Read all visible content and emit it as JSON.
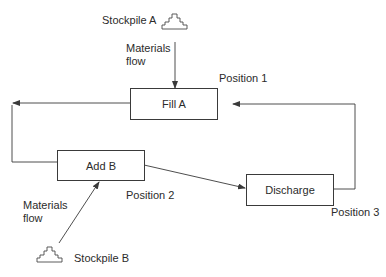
{
  "nodes": {
    "fill_a": {
      "label": "Fill A"
    },
    "add_b": {
      "label": "Add B"
    },
    "discharge": {
      "label": "Discharge"
    }
  },
  "positions": {
    "p1": "Position 1",
    "p2": "Position  2",
    "p3": "Position 3"
  },
  "sources": {
    "stockpile_a": {
      "label": "Stockpile A",
      "icon": "stockpile-icon"
    },
    "stockpile_b": {
      "label": "Stockpile B",
      "icon": "stockpile-icon"
    }
  },
  "flows": {
    "materials_a_line1": "Materials",
    "materials_a_line2": "flow",
    "materials_b_line1": "Materials",
    "materials_b_line2": "flow"
  },
  "edges": [
    {
      "from": "stockpile_a",
      "to": "fill_a"
    },
    {
      "from": "fill_a",
      "to": "add_b"
    },
    {
      "from": "add_b",
      "to": "discharge"
    },
    {
      "from": "discharge",
      "to": "fill_a"
    },
    {
      "from": "stockpile_b",
      "to": "add_b"
    }
  ],
  "colors": {
    "line": "#3a3a3a",
    "background": "#ffffff",
    "text": "#2b2b2b"
  }
}
